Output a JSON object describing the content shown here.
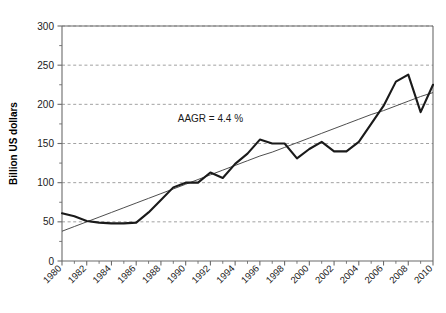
{
  "chart_data": {
    "type": "line",
    "title": "",
    "xlabel": "",
    "ylabel": "Billion US dollars",
    "xlim": [
      1980,
      2010
    ],
    "ylim": [
      0,
      300
    ],
    "ytick_step": 50,
    "yticks": [
      0,
      50,
      100,
      150,
      200,
      250,
      300
    ],
    "ytick_labels": [
      "0",
      "50",
      "100",
      "150",
      "200",
      "250",
      "300"
    ],
    "xticks": [
      1980,
      1982,
      1984,
      1986,
      1988,
      1990,
      1992,
      1994,
      1996,
      1998,
      2000,
      2002,
      2004,
      2006,
      2008,
      2010
    ],
    "xtick_labels": [
      "1980",
      "1982",
      "1984",
      "1986",
      "1988",
      "1990",
      "1992",
      "1994",
      "1996",
      "1998",
      "2000",
      "2002",
      "2004",
      "2006",
      "2008",
      "2010"
    ],
    "x_minor_ticks": true,
    "y_minor_ticks": true,
    "grid": true,
    "grid_axis": "y",
    "grid_style": "dashed",
    "legend": false,
    "annotations": [
      {
        "text": "AAGR = 4.4 %",
        "x": 1992,
        "y": 178
      }
    ],
    "x": [
      1980,
      1981,
      1982,
      1983,
      1984,
      1985,
      1986,
      1987,
      1988,
      1989,
      1990,
      1991,
      1992,
      1993,
      1994,
      1995,
      1996,
      1997,
      1998,
      1999,
      2000,
      2001,
      2002,
      2003,
      2004,
      2005,
      2006,
      2007,
      2008,
      2009,
      2010
    ],
    "series": [
      {
        "name": "Value",
        "type": "line",
        "color": "#1a1a1a",
        "values": [
          61,
          57,
          51,
          49,
          48,
          48,
          49,
          62,
          78,
          94,
          100,
          100,
          113,
          106,
          124,
          137,
          155,
          150,
          150,
          131,
          143,
          152,
          140,
          140,
          152,
          175,
          198,
          229,
          238,
          190,
          225
        ]
      },
      {
        "name": "Trend (AAGR 4.4 %)",
        "type": "line",
        "color": "#3a3a3a",
        "values": [
          38,
          44,
          50,
          56,
          62,
          68,
          74,
          80,
          86,
          92,
          98,
          104,
          110,
          116,
          122,
          128,
          134,
          139,
          145,
          151,
          157,
          163,
          169,
          175,
          181,
          187,
          192,
          198,
          204,
          210,
          215
        ]
      }
    ]
  }
}
